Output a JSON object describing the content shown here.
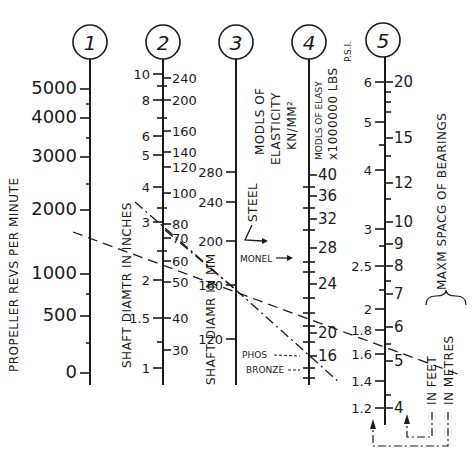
{
  "scales": [
    {
      "id": 1,
      "circle_label": "1",
      "caption": "PROPELLER REVS PER MINUTE",
      "ticks_left": [
        {
          "v": "5000",
          "y": 89
        },
        {
          "v": "4000",
          "y": 118
        },
        {
          "v": "3000",
          "y": 157
        },
        {
          "v": "2000",
          "y": 210
        },
        {
          "v": "1000",
          "y": 274
        },
        {
          "v": "500",
          "y": 316
        },
        {
          "v": "0",
          "y": 373
        }
      ]
    },
    {
      "id": 2,
      "circle_label": "2",
      "caption_left": "SHAFT DIAMTR IN INCHES",
      "caption_right": "SHAFT DIAMR IN MM",
      "ticks_left": [
        {
          "v": "10",
          "y": 74
        },
        {
          "v": "8",
          "y": 100
        },
        {
          "v": "6",
          "y": 136
        },
        {
          "v": "5",
          "y": 155
        },
        {
          "v": "4",
          "y": 187
        },
        {
          "v": "3",
          "y": 222
        },
        {
          "v": "2",
          "y": 280
        },
        {
          "v": "1.5",
          "y": 318
        },
        {
          "v": "1",
          "y": 368
        }
      ],
      "ticks_right": [
        {
          "v": "240",
          "y": 78
        },
        {
          "v": "200",
          "y": 100
        },
        {
          "v": "160",
          "y": 131
        },
        {
          "v": "140",
          "y": 152
        },
        {
          "v": "120",
          "y": 167
        },
        {
          "v": "100",
          "y": 193
        },
        {
          "v": "80",
          "y": 224
        },
        {
          "v": "70",
          "y": 238
        },
        {
          "v": "60",
          "y": 261
        },
        {
          "v": "50",
          "y": 282
        },
        {
          "v": "40",
          "y": 318
        },
        {
          "v": "30",
          "y": 350
        }
      ]
    },
    {
      "id": 3,
      "circle_label": "3",
      "caption": [
        "MODLS OF",
        "ELASTICITY",
        "KN/MM²"
      ],
      "ticks_left": [
        {
          "v": "280",
          "y": 172
        },
        {
          "v": "240",
          "y": 202
        },
        {
          "v": "200",
          "y": 241
        },
        {
          "v": "160",
          "y": 285
        },
        {
          "v": "120",
          "y": 339
        }
      ],
      "materials": [
        {
          "name": "STEEL",
          "y": 241
        },
        {
          "name": "MONEL",
          "y": 258
        },
        {
          "name_line1": "PHOS",
          "name_line2": "BRONZE",
          "y": 355
        }
      ]
    },
    {
      "id": 4,
      "circle_label": "4",
      "caption": [
        "MODLS OF ELASY",
        "x1000000 LBS",
        "P.S.I."
      ],
      "ticks_right": [
        {
          "v": "40",
          "y": 175
        },
        {
          "v": "36",
          "y": 196
        },
        {
          "v": "32",
          "y": 219
        },
        {
          "v": "28",
          "y": 248
        },
        {
          "v": "24",
          "y": 284
        },
        {
          "v": "20",
          "y": 333
        },
        {
          "v": "16",
          "y": 356
        }
      ]
    },
    {
      "id": 5,
      "circle_label": "5",
      "caption": "MAXM SPACG OF BEARINGS",
      "caption_feet": "IN FEET",
      "caption_metres": "IN METRES",
      "ticks_left": [
        {
          "v": "6",
          "y": 82
        },
        {
          "v": "5",
          "y": 122
        },
        {
          "v": "4",
          "y": 170
        },
        {
          "v": "3",
          "y": 229
        },
        {
          "v": "2.5",
          "y": 266
        },
        {
          "v": "2",
          "y": 309
        },
        {
          "v": "1.8",
          "y": 330
        },
        {
          "v": "1.6",
          "y": 354
        },
        {
          "v": "1.4",
          "y": 381
        },
        {
          "v": "1.2",
          "y": 408
        }
      ],
      "ticks_right": [
        {
          "v": "20",
          "y": 82
        },
        {
          "v": "15",
          "y": 138
        },
        {
          "v": "12",
          "y": 183
        },
        {
          "v": "10",
          "y": 222
        },
        {
          "v": "9",
          "y": 244
        },
        {
          "v": "8",
          "y": 266
        },
        {
          "v": "7",
          "y": 294
        },
        {
          "v": "6",
          "y": 327
        },
        {
          "v": "5",
          "y": 361
        },
        {
          "v": "4",
          "y": 408
        }
      ]
    }
  ],
  "labels": {
    "s1_caption": "PROPELLER REVS PER MINUTE",
    "s2_caption_left": "SHAFT DIAMTR IN INCHES",
    "s2_caption_right": "SHAFT DIAMR IN MM",
    "s3_line1": "MODLS OF",
    "s3_line2": "ELASTICITY",
    "s3_line3": "KN/MM²",
    "s4_line1": "MODLS OF ELASY",
    "s4_line2": "x1000000 LBS",
    "s4_line3": "P.S.I.",
    "s5_caption": "MAXM SPACG OF BEARINGS",
    "s5_feet": "IN FEET",
    "s5_metres": "IN METRES",
    "steel": "STEEL",
    "monel": "MONEL",
    "phos": "PHOS",
    "bronze": "BRONZE",
    "c1": "1",
    "c2": "2",
    "c3": "3",
    "c4": "4",
    "c5": "5"
  }
}
